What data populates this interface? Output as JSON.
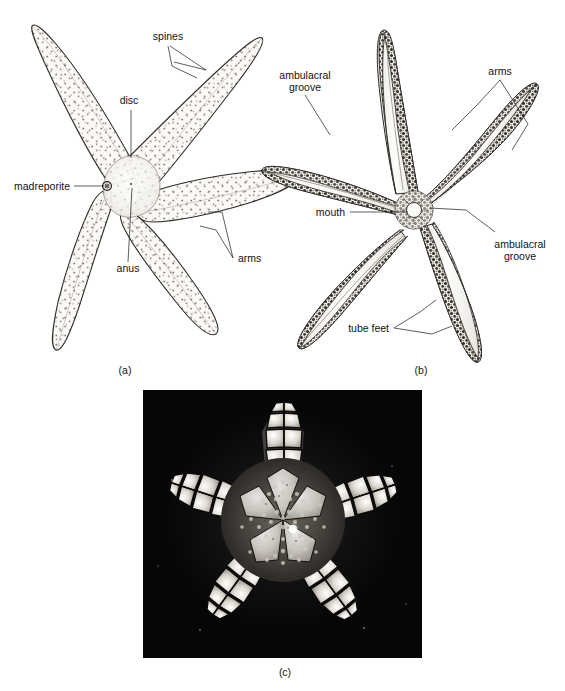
{
  "figure": {
    "background_color": "#ffffff",
    "ink_color": "#121212",
    "panels": [
      {
        "id": "a",
        "caption": "(a)",
        "view": "aboral (top) surface line drawing",
        "labels": [
          {
            "key": "spines",
            "text": "spines"
          },
          {
            "key": "disc",
            "text": "disc"
          },
          {
            "key": "madreporite",
            "text": "madreporite"
          },
          {
            "key": "anus",
            "text": "anus"
          },
          {
            "key": "arms",
            "text": "arms"
          }
        ]
      },
      {
        "id": "b",
        "caption": "(b)",
        "view": "oral (underside) surface line drawing",
        "labels": [
          {
            "key": "ambulacral_groove_top",
            "line1": "ambulacral",
            "line2": "groove"
          },
          {
            "key": "arms",
            "text": "arms"
          },
          {
            "key": "mouth",
            "text": "mouth"
          },
          {
            "key": "ambulacral_groove_right",
            "line1": "ambulacral",
            "line2": "groove"
          },
          {
            "key": "tube_feet",
            "text": "tube feet"
          }
        ]
      },
      {
        "id": "c",
        "caption": "(c)",
        "view": "photograph of dried sea star skeleton on black background",
        "photo_background_color": "#060606",
        "plate_color": "#d8d4cc",
        "labels": []
      }
    ]
  }
}
